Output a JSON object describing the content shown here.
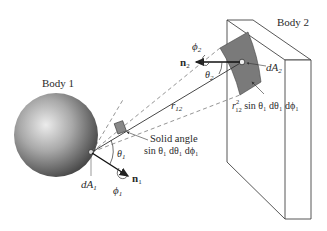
{
  "figure": {
    "type": "radiation view factor geometry",
    "body1": {
      "label": "Body 1",
      "area_label": "dA",
      "area_sub": "1",
      "normal_label": "n",
      "normal_sub": "1",
      "theta_label": "θ",
      "theta_sub": "1",
      "phi_label": "ϕ",
      "phi_sub": "1"
    },
    "body2": {
      "label": "Body 2",
      "area_label": "dA",
      "area_sub": "2",
      "normal_label": "n",
      "normal_sub": "2",
      "theta_label": "θ",
      "theta_sub": "2",
      "phi_label": "ϕ",
      "phi_sub": "2"
    },
    "distance": {
      "label": "r",
      "sub": "12"
    },
    "solid_angle": {
      "line1": "Solid angle",
      "line2": "sin θ₁ dθ₁ dϕ₁"
    },
    "projected_area": {
      "r": "r",
      "r_sub": "12",
      "r_sup": "2",
      "rest": " sin θ₁ dθ₁ dϕ₁"
    },
    "colors": {
      "sphere_light": "#e6e6e6",
      "sphere_dark": "#3a3a3a",
      "patch": "#7a7a7a",
      "line": "#333333",
      "dashed": "#666666"
    }
  }
}
